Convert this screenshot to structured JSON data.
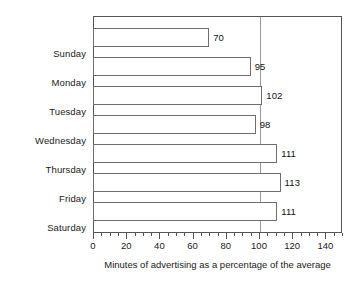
{
  "chart_data": {
    "type": "bar",
    "orientation": "horizontal",
    "title": "",
    "subtitle": "",
    "xlabel": "Minutes of advertising as a percentage of the average",
    "ylabel": "",
    "categories": [
      "Sunday",
      "Monday",
      "Tuesday",
      "Wednesday",
      "Thursday",
      "Friday",
      "Saturday"
    ],
    "values": [
      70,
      95,
      102,
      98,
      111,
      113,
      111
    ],
    "value_labels": [
      "70",
      "95",
      "102",
      "98",
      "111",
      "113",
      "111"
    ],
    "xlim": [
      0,
      150
    ],
    "xticks": [
      0,
      20,
      40,
      60,
      80,
      100,
      120,
      140
    ],
    "xticklabels": [
      "0",
      "20",
      "40",
      "60",
      "80",
      "100",
      "120",
      "140"
    ],
    "minor_tick_step": 5,
    "grid": false,
    "legend": false,
    "legend_position": "none",
    "reference_line": {
      "value": 100,
      "label": "",
      "color": "#9a9a9a"
    },
    "style": {
      "bar_fill": "#ffffff",
      "bar_edge": "#6e6e6e",
      "frame_color": "#555555",
      "text_color": "#1a1a1a",
      "background": "#ffffff"
    }
  }
}
